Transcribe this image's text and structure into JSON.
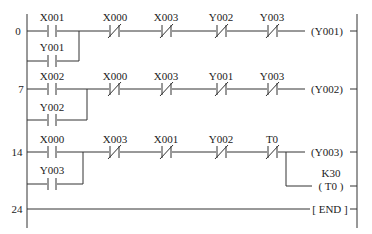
{
  "diagram": {
    "type": "ladder-logic",
    "rungs": [
      {
        "step": "0",
        "series": [
          {
            "address": "X001",
            "type": "NO"
          },
          {
            "address": "X000",
            "type": "NC"
          },
          {
            "address": "X003",
            "type": "NC"
          },
          {
            "address": "Y002",
            "type": "NC"
          },
          {
            "address": "Y003",
            "type": "NC"
          }
        ],
        "parallel": [
          {
            "address": "Y001",
            "type": "NO"
          }
        ],
        "outputs": [
          {
            "text": "(Y001)"
          }
        ]
      },
      {
        "step": "7",
        "series": [
          {
            "address": "X002",
            "type": "NO"
          },
          {
            "address": "X000",
            "type": "NC"
          },
          {
            "address": "X003",
            "type": "NC"
          },
          {
            "address": "Y001",
            "type": "NC"
          },
          {
            "address": "Y003",
            "type": "NC"
          }
        ],
        "parallel": [
          {
            "address": "Y002",
            "type": "NO"
          }
        ],
        "outputs": [
          {
            "text": "(Y002)"
          }
        ]
      },
      {
        "step": "14",
        "series": [
          {
            "address": "X000",
            "type": "NO"
          },
          {
            "address": "X003",
            "type": "NC"
          },
          {
            "address": "X001",
            "type": "NC"
          },
          {
            "address": "Y002",
            "type": "NC"
          },
          {
            "address": "T0",
            "type": "NC"
          }
        ],
        "parallel": [
          {
            "address": "Y003",
            "type": "NO"
          }
        ],
        "outputs": [
          {
            "text": "(Y003)"
          },
          {
            "text": "( T0 )",
            "preset": "K30"
          }
        ]
      },
      {
        "step": "24",
        "series": [],
        "parallel": [],
        "outputs": [
          {
            "text": "[ END ]"
          }
        ]
      }
    ]
  }
}
